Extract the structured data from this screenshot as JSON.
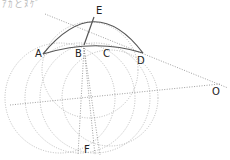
{
  "caption": "ｱｶとﾇｹﾞ",
  "labels": {
    "A": "A",
    "B": "B",
    "C": "C",
    "D": "D",
    "E": "E",
    "F": "F",
    "O": "O"
  },
  "colors": {
    "solid": "#555555",
    "dotted": "#aaaaaa",
    "text": "#222222"
  }
}
